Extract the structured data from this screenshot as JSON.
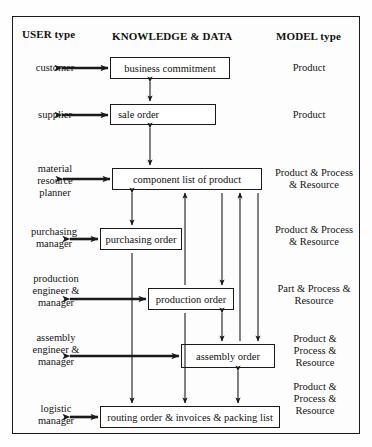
{
  "diagram": {
    "headers": {
      "left": "USER type",
      "center": "KNOWLEDGE & DATA",
      "right": "MODEL type"
    },
    "rows": [
      {
        "user": [
          "customer"
        ],
        "knowledge": "business commitment",
        "model": [
          "Product"
        ]
      },
      {
        "user": [
          "supplier"
        ],
        "knowledge": "sale order",
        "model": [
          "Product"
        ]
      },
      {
        "user": [
          "material",
          "resource",
          "planner"
        ],
        "knowledge": "component list of product",
        "model": [
          "Product & Process",
          "& Resource"
        ]
      },
      {
        "user": [
          "purchasing",
          "manager"
        ],
        "knowledge": "purchasing order",
        "model": [
          "Product & Process",
          "& Resource"
        ]
      },
      {
        "user": [
          "production",
          "engineer &",
          "manager"
        ],
        "knowledge": "production order",
        "model": [
          "Part & Process &",
          "Resource"
        ]
      },
      {
        "user": [
          "assembly",
          "engineer &",
          "manager"
        ],
        "knowledge": "assembly order",
        "model": [
          "Product &",
          "Process &",
          "Resource"
        ]
      },
      {
        "user": [
          "logistic",
          "manager"
        ],
        "knowledge": "routing order & invoices & packing list",
        "model": [
          "Product &",
          "Process &",
          "Resource"
        ]
      }
    ],
    "colors": {
      "line": "#1a1a1a",
      "box_border": "#1a1a1a",
      "background": "#fdfdfd",
      "text": "#141414"
    }
  }
}
